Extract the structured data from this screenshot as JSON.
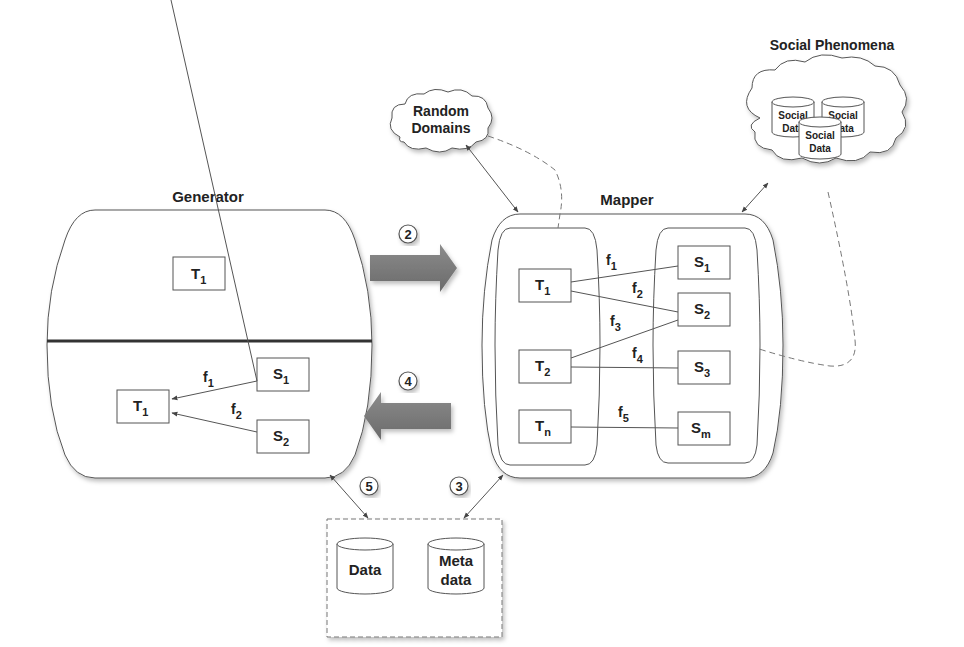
{
  "diagram": {
    "generator": {
      "title": "Generator",
      "top_node": {
        "base": "T",
        "sub": "1"
      },
      "bottom_target": {
        "base": "T",
        "sub": "1"
      },
      "bottom_sources": [
        {
          "base": "S",
          "sub": "1",
          "fn": {
            "base": "f",
            "sub": "1"
          }
        },
        {
          "base": "S",
          "sub": "2",
          "fn": {
            "base": "f",
            "sub": "2"
          }
        }
      ]
    },
    "mapper": {
      "title": "Mapper",
      "targets": [
        {
          "base": "T",
          "sub": "1"
        },
        {
          "base": "T",
          "sub": "2"
        },
        {
          "base": "T",
          "sub": "n"
        }
      ],
      "sources": [
        {
          "base": "S",
          "sub": "1"
        },
        {
          "base": "S",
          "sub": "2"
        },
        {
          "base": "S",
          "sub": "3"
        },
        {
          "base": "S",
          "sub": "m"
        }
      ],
      "functions": [
        {
          "base": "f",
          "sub": "1",
          "from": "T1",
          "to": "S1"
        },
        {
          "base": "f",
          "sub": "2",
          "from": "T1",
          "to": "S2"
        },
        {
          "base": "f",
          "sub": "3",
          "from": "T2",
          "to": "S2"
        },
        {
          "base": "f",
          "sub": "4",
          "from": "T2",
          "to": "S3"
        },
        {
          "base": "f",
          "sub": "5",
          "from": "Tn",
          "to": "Sm"
        }
      ]
    },
    "random_domains": {
      "line1": "Random",
      "line2": "Domains"
    },
    "social_phenomena": {
      "title": "Social Phenomena",
      "db1": {
        "line1": "Social",
        "line2": "Data"
      },
      "db2": {
        "line1": "Social",
        "line2": "Data"
      },
      "db3": {
        "line1": "Social",
        "line2": "Data"
      }
    },
    "storage": {
      "data": "Data",
      "meta_line1": "Meta",
      "meta_line2": "data"
    },
    "steps": {
      "s2": "2",
      "s3": "3",
      "s4": "4",
      "s5": "5"
    },
    "colors": {
      "arrow_fill": "#7a7a7a",
      "stroke": "#555555",
      "text": "#222222"
    }
  }
}
